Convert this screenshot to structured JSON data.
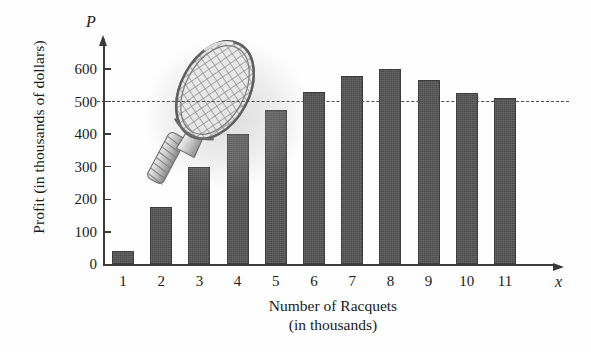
{
  "chart_data": {
    "type": "bar",
    "title": "",
    "xlabel": "Number of Racquets (in thousands)",
    "ylabel": "Profit (in thousands of dollars)",
    "x_axis_symbol": "x",
    "y_axis_symbol": "P",
    "categories": [
      "1",
      "2",
      "3",
      "4",
      "5",
      "6",
      "7",
      "8",
      "9",
      "10",
      "11"
    ],
    "values": [
      40,
      175,
      300,
      400,
      475,
      530,
      578,
      600,
      565,
      525,
      512
    ],
    "xlim": [
      0,
      12
    ],
    "ylim": [
      0,
      660
    ],
    "ytick_labels": [
      "0",
      "100",
      "200",
      "300",
      "400",
      "500",
      "600"
    ],
    "ytick_values": [
      0,
      100,
      200,
      300,
      400,
      500,
      600
    ],
    "grid": false,
    "legend": "none",
    "annotations": [
      {
        "name": "reference-line",
        "type": "horizontal-dashed-line",
        "value": 500,
        "style": "dashed"
      },
      {
        "name": "tennis-racquet-illustration",
        "type": "decorative-image",
        "description": "tennis racquet"
      }
    ],
    "bar_color": "#4a4a4a",
    "axis_color": "#3a3a3a",
    "background_color": "#ffffff"
  },
  "labels": {
    "xlabel_line1": "Number of Racquets",
    "xlabel_line2": "(in thousands)",
    "ylabel": "Profit (in thousands of dollars)",
    "p_symbol": "P",
    "x_symbol": "x"
  }
}
